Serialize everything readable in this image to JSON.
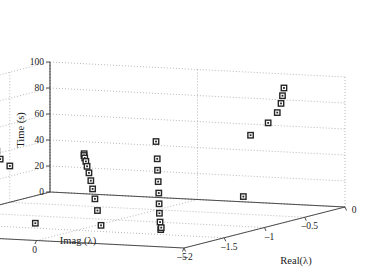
{
  "chart_data": {
    "type": "scatter",
    "projection": "3d",
    "title": "",
    "xlabel": "Real(λ)",
    "ylabel": "Imag.(λ)",
    "zlabel": "Time (s)",
    "xlim": [
      -2,
      0
    ],
    "ylim": [
      -5,
      5
    ],
    "zlim": [
      0,
      100
    ],
    "xticks": [
      -2,
      -1.5,
      -1,
      -0.5,
      0
    ],
    "xticklabels": [
      "–2",
      "–1.5",
      "–1",
      "–0.5",
      "0"
    ],
    "yticks": [
      5,
      0,
      -5
    ],
    "yticklabels": [
      "5",
      "0",
      "–5"
    ],
    "zticks": [
      0,
      20,
      40,
      60,
      80,
      100
    ],
    "zticklabels": [
      "0",
      "20",
      "40",
      "60",
      "80",
      "100"
    ],
    "grid": true,
    "legend": null,
    "marker": "square",
    "marker_color": "#262626",
    "marker_face": "#ffffff",
    "axis_color": "#4d4d4d",
    "grid_color": "#9a9a9a",
    "points": [
      {
        "x": -0.52,
        "y": -4.35,
        "z": 99.0
      },
      {
        "x": -0.52,
        "y": -4.3,
        "z": 93.0
      },
      {
        "x": -0.52,
        "y": -4.25,
        "z": 87.0
      },
      {
        "x": -0.53,
        "y": -4.15,
        "z": 80.0
      },
      {
        "x": -0.57,
        "y": -3.95,
        "z": 72.5
      },
      {
        "x": -0.66,
        "y": -3.6,
        "z": 64.0
      },
      {
        "x": -1.62,
        "y": 2.55,
        "z": 78.0
      },
      {
        "x": -1.62,
        "y": 2.5,
        "z": 72.0
      },
      {
        "x": -1.63,
        "y": 2.42,
        "z": 66.0
      },
      {
        "x": -1.65,
        "y": 2.3,
        "z": 60.5
      },
      {
        "x": -1.7,
        "y": 2.05,
        "z": 55.5
      },
      {
        "x": -1.8,
        "y": 1.45,
        "z": 52.5
      },
      {
        "x": -1.28,
        "y": 0.35,
        "z": 55.0
      },
      {
        "x": -1.3,
        "y": 0.3,
        "z": 54.0
      },
      {
        "x": -1.32,
        "y": 0.22,
        "z": 52.5
      },
      {
        "x": -1.35,
        "y": 0.1,
        "z": 50.5
      },
      {
        "x": -1.39,
        "y": -0.05,
        "z": 47.5
      },
      {
        "x": -1.44,
        "y": -0.25,
        "z": 43.5
      },
      {
        "x": -1.49,
        "y": -0.45,
        "z": 38.5
      },
      {
        "x": -1.53,
        "y": -0.62,
        "z": 33.0
      },
      {
        "x": -1.56,
        "y": -0.78,
        "z": 26.0
      },
      {
        "x": -1.58,
        "y": -0.92,
        "z": 17.5
      },
      {
        "x": -1.62,
        "y": -1.15,
        "z": 7.0
      },
      {
        "x": -0.9,
        "y": -1.05,
        "z": 60.0
      },
      {
        "x": -0.94,
        "y": -1.2,
        "z": 47.5
      },
      {
        "x": -0.98,
        "y": -1.32,
        "z": 39.5
      },
      {
        "x": -1.02,
        "y": -1.45,
        "z": 31.5
      },
      {
        "x": -1.06,
        "y": -1.58,
        "z": 23.5
      },
      {
        "x": -1.1,
        "y": -1.7,
        "z": 16.0
      },
      {
        "x": -1.14,
        "y": -1.82,
        "z": 9.5
      },
      {
        "x": -1.18,
        "y": -1.95,
        "z": 3.5
      },
      {
        "x": -1.3,
        "y": -2.3,
        "z": 0.0
      },
      {
        "x": -1.22,
        "y": -2.1,
        "z": 0.0
      },
      {
        "x": -0.42,
        "y": -2.7,
        "z": 12.0
      },
      {
        "x": -1.3,
        "y": 1.95,
        "z": 0.0
      }
    ]
  },
  "axis_titles": {
    "x": "Real(λ)",
    "y": "Imag.(λ)",
    "z": "Time (s)"
  }
}
